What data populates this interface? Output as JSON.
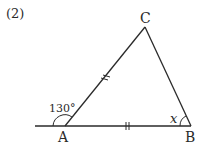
{
  "problem_number": "(2)",
  "vertices": {
    "A": "A",
    "B": "B",
    "C": "C"
  },
  "exterior_angle_label": "130°",
  "unknown_angle_label": "x",
  "equal_sides": [
    "CA",
    "AB"
  ]
}
